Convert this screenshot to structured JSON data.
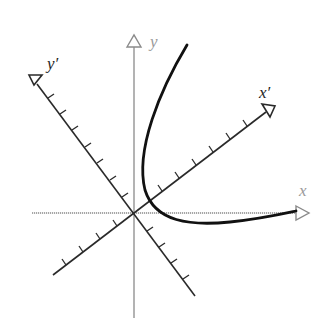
{
  "diagram": {
    "labels": {
      "x": "x",
      "y": "y",
      "x_prime": "x′",
      "y_prime": "y′"
    },
    "colors": {
      "original_axes": "#8a8a8a",
      "rotated_axes": "#2a2a2a",
      "curve": "#111111",
      "background": "#ffffff"
    },
    "origin": [
      134,
      213
    ],
    "rotation_angle_deg": 37,
    "ticks_per_half_axis": 6,
    "curve_type": "parabola"
  }
}
